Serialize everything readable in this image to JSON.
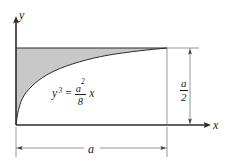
{
  "figure": {
    "type": "math-diagram",
    "background_color": "#ffffff",
    "line_color": "#1a1a1a",
    "shade_color": "#c8c8c8"
  },
  "axes": {
    "y_label": "y",
    "x_label": "x",
    "origin_x": 16,
    "origin_y": 125
  },
  "curve": {
    "equation_parts": {
      "lhs_base": "y",
      "lhs_exponent": "3",
      "equals": "=",
      "numerator_base": "a",
      "numerator_exponent": "2",
      "denominator": "8",
      "trailing_variable": "x"
    },
    "equation_plain": "y^3 = (a^2/8) x",
    "x_start": 0,
    "x_end": 1,
    "y_at_x_end": 1
  },
  "dimensions": [
    {
      "name": "horizontal-width",
      "label": "a",
      "orientation": "horizontal",
      "start_px": 16,
      "end_px": 167,
      "y_px": 148
    },
    {
      "name": "vertical-height",
      "label_numerator": "a",
      "label_denominator": "2",
      "label_plain": "a/2",
      "orientation": "vertical",
      "start_px": 48,
      "end_px": 125,
      "x_px": 190
    }
  ],
  "region": {
    "fill": "#c8c8c8",
    "bounded_above_by": "horizontal line y = a/2",
    "bounded_below_by": "curve y^3 = (a^2/8) x",
    "bounded_left_by": "y axis"
  }
}
